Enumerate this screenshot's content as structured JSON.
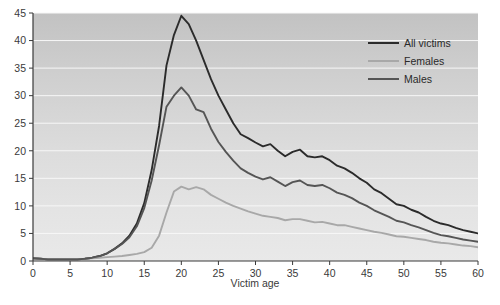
{
  "chart_data": {
    "type": "line",
    "title": "",
    "subtitle": "",
    "xlabel": "Victim age",
    "ylabel": "",
    "xlim": [
      0,
      60
    ],
    "ylim": [
      0,
      45
    ],
    "xticks": [
      0,
      5,
      10,
      15,
      20,
      25,
      30,
      35,
      40,
      45,
      50,
      55,
      60
    ],
    "yticks": [
      0,
      5,
      10,
      15,
      20,
      25,
      30,
      35,
      40,
      45
    ],
    "xtick_labels": [
      "0",
      "5",
      "10",
      "15",
      "20",
      "25",
      "30",
      "35",
      "40",
      "45",
      "50",
      "55",
      "60"
    ],
    "ytick_labels": [
      "0",
      "5",
      "10",
      "15",
      "20",
      "25",
      "30",
      "35",
      "40",
      "45"
    ],
    "grid": "horizontal",
    "legend_position": "top-right",
    "background": "vertical-gradient-gray",
    "x": [
      0,
      1,
      2,
      3,
      4,
      5,
      6,
      7,
      8,
      9,
      10,
      11,
      12,
      13,
      14,
      15,
      16,
      17,
      18,
      19,
      20,
      21,
      22,
      23,
      24,
      25,
      26,
      27,
      28,
      29,
      30,
      31,
      32,
      33,
      34,
      35,
      36,
      37,
      38,
      39,
      40,
      41,
      42,
      43,
      44,
      45,
      46,
      47,
      48,
      49,
      50,
      51,
      52,
      53,
      54,
      55,
      56,
      57,
      58,
      59,
      60
    ],
    "series": [
      {
        "name": "All victims",
        "color": "#2b2b2b",
        "width": 1.9,
        "values": [
          0.5,
          0.4,
          0.3,
          0.3,
          0.3,
          0.3,
          0.3,
          0.4,
          0.6,
          0.9,
          1.4,
          2.2,
          3.2,
          4.6,
          6.8,
          10.5,
          16.5,
          24.5,
          35.5,
          41.0,
          44.5,
          43.0,
          40.0,
          36.5,
          33.0,
          30.0,
          27.5,
          25.0,
          23.0,
          22.3,
          21.5,
          20.8,
          21.2,
          20.0,
          19.0,
          19.8,
          20.2,
          19.0,
          18.8,
          19.0,
          18.3,
          17.3,
          16.8,
          16.0,
          15.0,
          14.2,
          13.0,
          12.3,
          11.3,
          10.3,
          10.0,
          9.3,
          8.8,
          8.0,
          7.3,
          6.8,
          6.5,
          6.0,
          5.6,
          5.3,
          5.0
        ]
      },
      {
        "name": "Females",
        "color": "#a8a8a8",
        "width": 1.9,
        "values": [
          0.5,
          0.4,
          0.3,
          0.3,
          0.3,
          0.3,
          0.3,
          0.4,
          0.5,
          0.6,
          0.7,
          0.8,
          0.9,
          1.1,
          1.3,
          1.6,
          2.4,
          4.6,
          8.8,
          12.6,
          13.5,
          13.0,
          13.4,
          13.0,
          12.0,
          11.3,
          10.6,
          10.0,
          9.5,
          9.0,
          8.6,
          8.2,
          8.0,
          7.8,
          7.4,
          7.6,
          7.6,
          7.3,
          7.0,
          7.1,
          6.8,
          6.5,
          6.5,
          6.2,
          5.9,
          5.6,
          5.3,
          5.1,
          4.8,
          4.5,
          4.4,
          4.2,
          4.0,
          3.8,
          3.5,
          3.3,
          3.2,
          3.0,
          2.8,
          2.7,
          2.5
        ]
      },
      {
        "name": "Males",
        "color": "#555555",
        "width": 1.9,
        "values": [
          0.5,
          0.4,
          0.3,
          0.3,
          0.3,
          0.3,
          0.3,
          0.4,
          0.6,
          0.9,
          1.4,
          2.2,
          3.1,
          4.3,
          6.3,
          9.6,
          14.6,
          21.0,
          28.0,
          30.0,
          31.5,
          30.0,
          27.5,
          27.0,
          24.0,
          21.6,
          19.8,
          18.2,
          16.8,
          16.0,
          15.3,
          14.8,
          15.2,
          14.4,
          13.6,
          14.3,
          14.6,
          13.8,
          13.6,
          13.8,
          13.2,
          12.4,
          12.0,
          11.4,
          10.6,
          10.0,
          9.2,
          8.6,
          8.0,
          7.3,
          7.0,
          6.5,
          6.1,
          5.6,
          5.1,
          4.7,
          4.5,
          4.2,
          3.9,
          3.7,
          3.5
        ]
      }
    ]
  },
  "legend": {
    "entries": [
      {
        "label": "All victims",
        "color": "#2b2b2b"
      },
      {
        "label": "Females",
        "color": "#a8a8a8"
      },
      {
        "label": "Males",
        "color": "#555555"
      }
    ]
  },
  "axis": {
    "x_title": "Victim age"
  }
}
